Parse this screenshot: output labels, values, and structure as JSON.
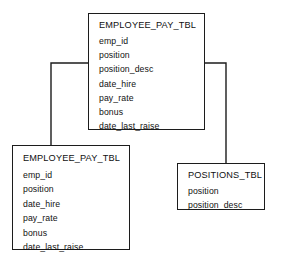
{
  "diagram": {
    "type": "database-entity-relationship-diagram",
    "background_color": "#ffffff",
    "line_color": "#1c1c1c",
    "text_color": "#111111",
    "entities": [
      {
        "id": "employee-pay-top",
        "title": "EMPLOYEE_PAY_TBL",
        "fields": [
          "emp_id",
          "position",
          "position_desc",
          "date_hire",
          "pay_rate",
          "bonus",
          "date_last_raise"
        ]
      },
      {
        "id": "employee-pay-bottom",
        "title": "EMPLOYEE_PAY_TBL",
        "fields": [
          "emp_id",
          "position",
          "date_hire",
          "pay_rate",
          "bonus",
          "date_last_raise"
        ]
      },
      {
        "id": "positions",
        "title": "POSITIONS_TBL",
        "fields": [
          "position",
          "position_desc"
        ]
      }
    ],
    "connectors": [
      {
        "id": "top-to-bottom-left",
        "from": "employee-pay-top",
        "to": "employee-pay-bottom",
        "path": "M 88 63 L 51 63 L 51 145"
      },
      {
        "id": "position-group-bracket",
        "from": "employee-pay-top",
        "to": "employee-pay-top",
        "path": "M 147 47 L 170 47 L 170 63 L 147 63"
      },
      {
        "id": "top-to-positions",
        "from": "employee-pay-top",
        "to": "positions",
        "path": "M 170 63 L 226 63 L 226 163"
      }
    ]
  }
}
